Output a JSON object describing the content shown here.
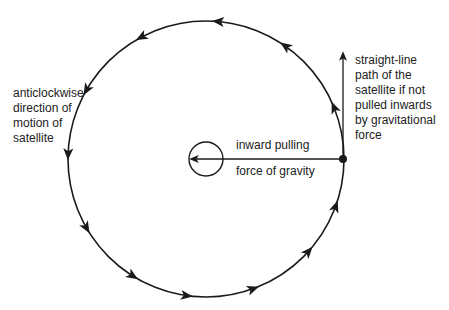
{
  "diagram": {
    "type": "circular-orbit-force-diagram",
    "orbit": {
      "center": [
        206,
        159
      ],
      "radius": 138,
      "direction": "anticlockwise",
      "arrow_count": 12
    },
    "satellite": {
      "position": [
        343,
        159
      ]
    },
    "gravity_arrow": {
      "from": [
        343,
        159
      ],
      "to": [
        192,
        159
      ]
    },
    "central_body": {
      "center": [
        206,
        159
      ],
      "radius": 17
    },
    "tangent_arrow": {
      "from": [
        343,
        159
      ],
      "to": [
        343,
        52
      ]
    },
    "colors": {
      "line": "#1a1a1a",
      "text": "#222222",
      "background": "#ffffff"
    }
  },
  "labels": {
    "anticlockwise": "anticlockwise\ndirection of\nmotion of\nsatellite",
    "straight_line": "straight-line\npath of the\nsatellite if not\npulled inwards\nby gravitational\nforce",
    "inward_pulling": "inward pulling",
    "force_of_gravity": "force of gravity"
  }
}
